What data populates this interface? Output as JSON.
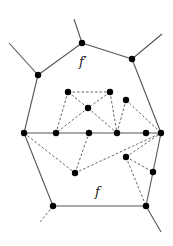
{
  "diagram": {
    "labels": [
      {
        "id": "f_prime",
        "text": "f′",
        "x": 79,
        "y": 66
      },
      {
        "id": "f",
        "text": "f",
        "x": 95,
        "y": 196
      }
    ],
    "nodes": [
      {
        "id": "A",
        "x": 82,
        "y": 43
      },
      {
        "id": "B",
        "x": 38,
        "y": 75
      },
      {
        "id": "C",
        "x": 132,
        "y": 59
      },
      {
        "id": "D",
        "x": 24,
        "y": 133
      },
      {
        "id": "F",
        "x": 56,
        "y": 133
      },
      {
        "id": "G",
        "x": 89,
        "y": 133
      },
      {
        "id": "H",
        "x": 117,
        "y": 133
      },
      {
        "id": "I",
        "x": 146,
        "y": 133
      },
      {
        "id": "E",
        "x": 161,
        "y": 133
      },
      {
        "id": "J",
        "x": 68,
        "y": 92
      },
      {
        "id": "K",
        "x": 110,
        "y": 92
      },
      {
        "id": "L",
        "x": 88,
        "y": 108
      },
      {
        "id": "M",
        "x": 126,
        "y": 100
      },
      {
        "id": "N",
        "x": 75,
        "y": 173
      },
      {
        "id": "O",
        "x": 126,
        "y": 157
      },
      {
        "id": "P",
        "x": 153,
        "y": 172
      },
      {
        "id": "Q",
        "x": 53,
        "y": 206
      },
      {
        "id": "R",
        "x": 146,
        "y": 206
      }
    ],
    "solid_edges": [
      [
        82,
        43,
        38,
        75
      ],
      [
        82,
        43,
        132,
        59
      ],
      [
        82,
        43,
        74,
        19
      ],
      [
        38,
        75,
        9,
        43
      ],
      [
        132,
        59,
        162,
        34
      ],
      [
        38,
        75,
        24,
        133
      ],
      [
        132,
        59,
        161,
        133
      ],
      [
        24,
        133,
        161,
        133
      ],
      [
        24,
        133,
        53,
        206
      ],
      [
        161,
        133,
        153,
        172
      ],
      [
        153,
        172,
        146,
        206
      ],
      [
        53,
        206,
        146,
        206
      ],
      [
        146,
        206,
        161,
        232
      ]
    ],
    "dashed_edges": [
      [
        68,
        92,
        110,
        92
      ],
      [
        68,
        92,
        88,
        108
      ],
      [
        110,
        92,
        88,
        108
      ],
      [
        68,
        92,
        56,
        133
      ],
      [
        88,
        108,
        56,
        133
      ],
      [
        88,
        108,
        117,
        133
      ],
      [
        110,
        92,
        117,
        133
      ],
      [
        126,
        100,
        117,
        133
      ],
      [
        126,
        100,
        161,
        133
      ],
      [
        24,
        133,
        75,
        173
      ],
      [
        75,
        173,
        89,
        133
      ],
      [
        75,
        173,
        161,
        133
      ],
      [
        126,
        157,
        161,
        133
      ],
      [
        126,
        157,
        153,
        172
      ],
      [
        126,
        157,
        146,
        206
      ],
      [
        53,
        206,
        40,
        222
      ]
    ]
  }
}
